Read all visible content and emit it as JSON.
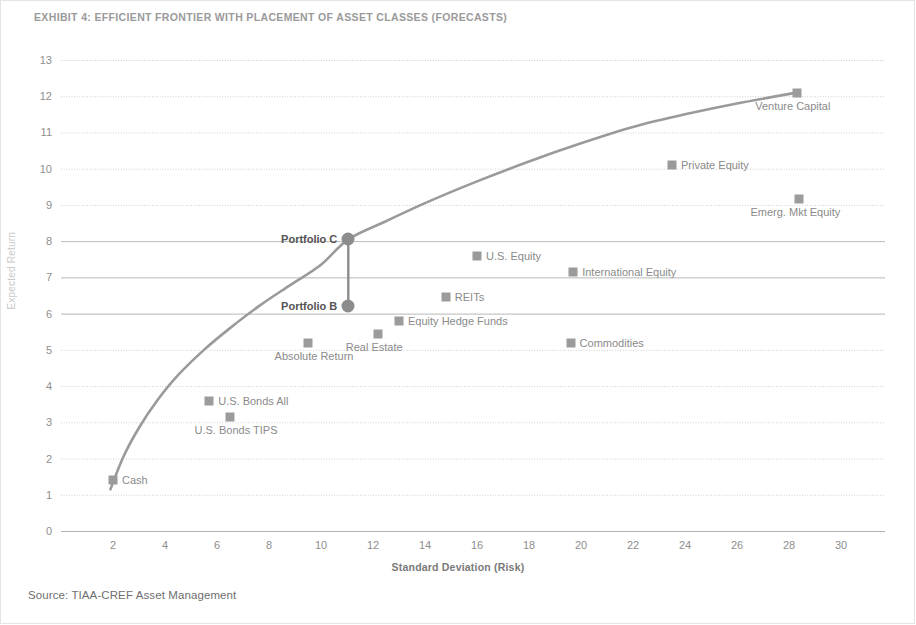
{
  "title": "EXHIBIT 4: EFFICIENT FRONTIER WITH PLACEMENT OF ASSET CLASSES (FORECASTS)",
  "source": "Source: TIAA-CREF Asset Management",
  "colors": {
    "marker": "#9b9b9b",
    "portfolio_marker": "#8c8c8c",
    "frontier_line": "#9a9a9a",
    "gridline_minor": "#cfcfcf",
    "gridline_major": "#b8b8b8",
    "axis": "#b0b0b0",
    "text": "#8a8a8a",
    "title_text": "#9a9a9a"
  },
  "chart_data": {
    "type": "scatter",
    "title": "EXHIBIT 4: EFFICIENT FRONTIER WITH PLACEMENT OF ASSET CLASSES (FORECASTS)",
    "xlabel": "Standard Deviation (Risk)",
    "ylabel": "Expected Return",
    "xlim": [
      0,
      31
    ],
    "ylim": [
      0,
      13
    ],
    "xticks": [
      2,
      4,
      6,
      8,
      10,
      12,
      14,
      16,
      18,
      20,
      22,
      24,
      26,
      28,
      30
    ],
    "yticks": [
      0,
      1,
      2,
      3,
      4,
      5,
      6,
      7,
      8,
      9,
      10,
      11,
      12,
      13
    ],
    "grid": true,
    "legend": "none",
    "series": [
      {
        "name": "Asset Classes",
        "marker": "square",
        "points": [
          {
            "label": "Cash",
            "x": 2.0,
            "y": 1.4,
            "label_pos": "right"
          },
          {
            "label": "U.S. Bonds TIPS",
            "x": 6.5,
            "y": 3.15,
            "label_pos": "below"
          },
          {
            "label": "U.S. Bonds All",
            "x": 5.7,
            "y": 3.6,
            "label_pos": "right"
          },
          {
            "label": "Absolute Return",
            "x": 9.5,
            "y": 5.2,
            "label_pos": "below"
          },
          {
            "label": "Real Estate",
            "x": 12.2,
            "y": 5.45,
            "label_pos": "below-left"
          },
          {
            "label": "Equity Hedge Funds",
            "x": 13.0,
            "y": 5.8,
            "label_pos": "right"
          },
          {
            "label": "Commodities",
            "x": 19.6,
            "y": 5.2,
            "label_pos": "right"
          },
          {
            "label": "REITs",
            "x": 14.8,
            "y": 6.45,
            "label_pos": "right"
          },
          {
            "label": "International Equity",
            "x": 19.7,
            "y": 7.15,
            "label_pos": "right"
          },
          {
            "label": "U.S. Equity",
            "x": 16.0,
            "y": 7.6,
            "label_pos": "right"
          },
          {
            "label": "Emerg. Mkt Equity",
            "x": 28.4,
            "y": 9.15,
            "label_pos": "below-left"
          },
          {
            "label": "Private Equity",
            "x": 23.5,
            "y": 10.1,
            "label_pos": "right"
          },
          {
            "label": "Venture Capital",
            "x": 28.3,
            "y": 12.1,
            "label_pos": "below-left"
          }
        ]
      },
      {
        "name": "Portfolios",
        "marker": "circle",
        "points": [
          {
            "label": "Portfolio C",
            "x": 11.05,
            "y": 8.05,
            "label_pos": "left"
          },
          {
            "label": "Portfolio B",
            "x": 11.05,
            "y": 6.2,
            "label_pos": "left"
          }
        ]
      }
    ],
    "frontier_curve": {
      "name": "Efficient Frontier",
      "points": [
        {
          "x": 1.9,
          "y": 1.15
        },
        {
          "x": 2.4,
          "y": 2.05
        },
        {
          "x": 3.0,
          "y": 2.85
        },
        {
          "x": 3.7,
          "y": 3.6
        },
        {
          "x": 4.5,
          "y": 4.3
        },
        {
          "x": 5.5,
          "y": 5.0
        },
        {
          "x": 6.5,
          "y": 5.6
        },
        {
          "x": 7.6,
          "y": 6.2
        },
        {
          "x": 8.8,
          "y": 6.78
        },
        {
          "x": 10.0,
          "y": 7.35
        },
        {
          "x": 11.05,
          "y": 8.05
        },
        {
          "x": 12.5,
          "y": 8.55
        },
        {
          "x": 14.0,
          "y": 9.05
        },
        {
          "x": 16.0,
          "y": 9.65
        },
        {
          "x": 18.0,
          "y": 10.2
        },
        {
          "x": 20.0,
          "y": 10.7
        },
        {
          "x": 22.0,
          "y": 11.15
        },
        {
          "x": 24.0,
          "y": 11.5
        },
        {
          "x": 26.0,
          "y": 11.8
        },
        {
          "x": 28.3,
          "y": 12.1
        }
      ]
    },
    "connector": {
      "name": "Portfolio B to C connector",
      "from": {
        "x": 11.05,
        "y": 6.2
      },
      "to": {
        "x": 11.05,
        "y": 8.05
      }
    }
  }
}
